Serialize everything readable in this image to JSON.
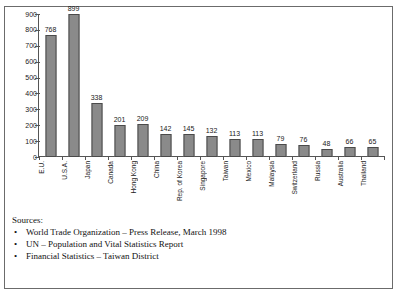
{
  "chart_data": {
    "type": "bar",
    "title": "",
    "xlabel": "",
    "ylabel": "",
    "ylim": [
      0,
      900
    ],
    "yticks": [
      0,
      100,
      200,
      300,
      400,
      500,
      600,
      700,
      800,
      900
    ],
    "grid": false,
    "legend": false,
    "bar_color": "#8a8a8a",
    "bar_edge_color": "#4a4a4a",
    "categories": [
      "E.U.",
      "U.S.A.",
      "Japan",
      "Canada",
      "Hong Kong",
      "China",
      "Rep. of Korea",
      "Singapore",
      "Taiwan",
      "Mexico",
      "Malaysia",
      "Switzerland",
      "Russia",
      "Australia",
      "Thailand"
    ],
    "values": [
      768,
      899,
      338,
      201,
      209,
      142,
      145,
      132,
      113,
      113,
      79,
      76,
      48,
      66,
      65
    ]
  },
  "sources": {
    "heading": "Sources:",
    "bullet": "•",
    "items": [
      "World Trade Organization – Press Release, March 1998",
      "UN – Population and Vital Statistics Report",
      "Financial Statistics – Taiwan District"
    ]
  }
}
